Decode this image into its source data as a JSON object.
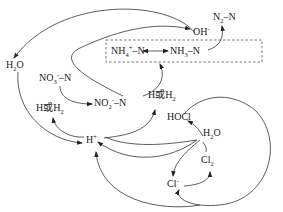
{
  "diagram": {
    "type": "chemical-reaction-cycle",
    "nodes": {
      "oh": {
        "base": "OH",
        "sup": "-"
      },
      "n2": {
        "base1": "N",
        "sub1": "2",
        "rest": "–N"
      },
      "nh4": {
        "base": "NH",
        "sub": "4",
        "sup": "+",
        "rest": "–N"
      },
      "nh3": {
        "base": "NH",
        "sub": "3",
        "rest": "–N"
      },
      "h2o_left": {
        "base": "H",
        "sub": "2",
        "rest": "O"
      },
      "no3": {
        "base": "NO",
        "sub": "3",
        "sup": "-",
        "rest": "–N"
      },
      "no2": {
        "base": "NO",
        "sub": "2",
        "sup": "-",
        "rest": "–N"
      },
      "h_or_h2_left": {
        "pre": "H或H",
        "sub": "2"
      },
      "h_or_h2_right": {
        "pre": "H或H",
        "sub": "2"
      },
      "h_plus": {
        "base": "H",
        "sup": "+"
      },
      "hocl": {
        "text": "HOCl"
      },
      "h2o_right": {
        "base": "H",
        "sub": "2",
        "rest": "O"
      },
      "cl2": {
        "base": "Cl",
        "sub": "2"
      },
      "cl_minus": {
        "base": "Cl",
        "sup": "-"
      }
    },
    "edges": [
      {
        "from": "NH4+-N",
        "to": "NH3-N",
        "bidirectional": true
      },
      {
        "from": "NH3-N",
        "to": "N2-N"
      },
      {
        "from": "NO3--N",
        "to": "NO2--N"
      },
      {
        "from": "NO2--N",
        "to": "NH4+-N"
      },
      {
        "from": "NO2--N",
        "to": "OH-"
      },
      {
        "from": "H+",
        "to": "H或H2 (left)"
      },
      {
        "from": "H+",
        "to": "H或H2 (right)"
      },
      {
        "from": "H2O (left)",
        "to": "H+"
      },
      {
        "from": "OH-",
        "to": "H2O (left)"
      },
      {
        "from": "H2O (right)",
        "to": "HOCl"
      },
      {
        "from": "H2O (right)",
        "to": "Cl-"
      },
      {
        "from": "HOCl",
        "to": "H+"
      },
      {
        "from": "Cl-",
        "to": "Cl2"
      },
      {
        "from": "Cl2",
        "to": "H+"
      },
      {
        "from": "large loop",
        "to": "Cl-"
      }
    ]
  }
}
